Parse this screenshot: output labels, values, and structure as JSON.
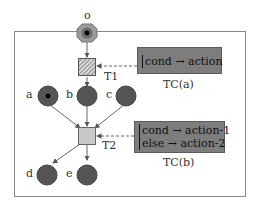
{
  "diagram": {
    "type": "petri-net-with-transition-conditions",
    "colors": {
      "place_fill": "#555555",
      "place_stroke": "#444444",
      "token": "#000000",
      "outer_place_fill": "#9a9a9a",
      "t1_fill": "#b5b5b5",
      "t2_fill": "#c8c8c8",
      "tc_fill": "#7d7d7d",
      "border": "#888888",
      "edge": "#555555"
    },
    "outer_place": {
      "label": "o",
      "has_token": true
    },
    "places": [
      {
        "id": "a",
        "label": "a",
        "has_token": true
      },
      {
        "id": "b",
        "label": "b",
        "has_token": false
      },
      {
        "id": "c",
        "label": "c",
        "has_token": false
      },
      {
        "id": "d",
        "label": "d",
        "has_token": false
      },
      {
        "id": "e",
        "label": "e",
        "has_token": false
      }
    ],
    "transitions": [
      {
        "id": "T1",
        "label": "T1",
        "style": "hatched"
      },
      {
        "id": "T2",
        "label": "T2",
        "style": "plain"
      }
    ],
    "conditions": [
      {
        "id": "TC(a)",
        "caption": "TC(a)",
        "lines": [
          "cond → action"
        ],
        "attached_to": "T1"
      },
      {
        "id": "TC(b)",
        "caption": "TC(b)",
        "lines": [
          "cond → action-1",
          "else → action-2"
        ],
        "attached_to": "T2"
      }
    ],
    "edges": [
      {
        "from": "o",
        "to": "T1"
      },
      {
        "from": "T1",
        "to": "b"
      },
      {
        "from": "a",
        "to": "T2"
      },
      {
        "from": "b",
        "to": "T2"
      },
      {
        "from": "c",
        "to": "T2"
      },
      {
        "from": "T2",
        "to": "d"
      },
      {
        "from": "T2",
        "to": "e"
      },
      {
        "from": "TC(a)",
        "to": "T1",
        "style": "dashed"
      },
      {
        "from": "TC(b)",
        "to": "T2",
        "style": "dashed"
      }
    ]
  }
}
